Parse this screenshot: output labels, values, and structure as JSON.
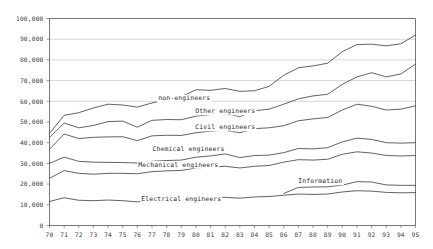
{
  "chart_data": {
    "type": "line",
    "title": "",
    "subtitle": "",
    "xlabel": "",
    "ylabel": "",
    "xlim": [
      70,
      95
    ],
    "ylim": [
      0,
      100000
    ],
    "grid": "horizontal-major-upper",
    "legend_position": "inline-labels",
    "y_ticks": [
      0,
      10000,
      20000,
      30000,
      40000,
      50000,
      60000,
      70000,
      80000,
      90000,
      100000
    ],
    "y_tick_labels": [
      "0",
      "10,000",
      "20,000",
      "30,000",
      "40,000",
      "50,000",
      "60,000",
      "70,000",
      "80,000",
      "90,000",
      "100,000"
    ],
    "x": [
      70,
      71,
      72,
      73,
      74,
      75,
      76,
      77,
      78,
      79,
      80,
      81,
      82,
      83,
      84,
      85,
      86,
      87,
      88,
      89,
      90,
      91,
      92,
      93,
      94,
      95
    ],
    "x_tick_labels": [
      "70",
      "71",
      "72",
      "73",
      "74",
      "75",
      "76",
      "77",
      "78",
      "79",
      "80",
      "81",
      "82",
      "83",
      "84",
      "85",
      "86",
      "87",
      "88",
      "89",
      "90",
      "91",
      "92",
      "93",
      "94",
      "95"
    ],
    "series": [
      {
        "name": "non-engineers",
        "label": "non-engineers",
        "label_x": 79.2,
        "label_y": 60500,
        "values": [
          44500,
          53200,
          54500,
          56800,
          58600,
          58200,
          57200,
          59200,
          60800,
          62200,
          65600,
          65300,
          66200,
          64800,
          65100,
          67200,
          72600,
          76200,
          77100,
          78400,
          84000,
          87400,
          87600,
          86800,
          87800,
          92000
        ]
      },
      {
        "name": "other-engineers",
        "label": "Other engineers",
        "label_x": 82.0,
        "label_y": 54200,
        "values": [
          42500,
          49500,
          47200,
          48300,
          50200,
          50400,
          47500,
          50800,
          51200,
          51100,
          52800,
          53600,
          54200,
          52600,
          55400,
          56200,
          58600,
          61200,
          62600,
          63400,
          68200,
          71800,
          73800,
          71800,
          73200,
          78000
        ]
      },
      {
        "name": "civil-engineers",
        "label": "Civil engineers",
        "label_x": 82.0,
        "label_y": 46500,
        "values": [
          36800,
          44200,
          42000,
          42600,
          42800,
          42900,
          41000,
          43300,
          43600,
          43500,
          44800,
          45600,
          46000,
          44800,
          46800,
          47200,
          48200,
          50600,
          51500,
          52200,
          55800,
          58600,
          57600,
          55800,
          56200,
          57800
        ]
      },
      {
        "name": "chemical-engineers",
        "label": "Chemical engineers",
        "label_x": 79.5,
        "label_y": 36200,
        "values": [
          30000,
          33000,
          31000,
          30600,
          30500,
          30400,
          30200,
          31000,
          31400,
          31600,
          33000,
          33600,
          34600,
          32800,
          33800,
          34000,
          35200,
          37200,
          37000,
          37600,
          40400,
          42200,
          41600,
          40000,
          39800,
          40000
        ]
      },
      {
        "name": "mechanical-engineers",
        "label": "Mechanical engineers",
        "label_x": 78.8,
        "label_y": 28500,
        "values": [
          22800,
          26500,
          25200,
          24800,
          25200,
          25200,
          25000,
          26000,
          26400,
          26600,
          27800,
          28200,
          28600,
          27800,
          28600,
          29000,
          30600,
          31800,
          31600,
          32000,
          34400,
          35600,
          35000,
          33800,
          33600,
          33800
        ]
      },
      {
        "name": "information",
        "label": "Information",
        "label_x": 88.5,
        "label_y": 20400,
        "start_index": 16,
        "values": [
          null,
          null,
          null,
          null,
          null,
          null,
          null,
          null,
          null,
          null,
          null,
          null,
          null,
          null,
          null,
          null,
          15500,
          18400,
          18600,
          18700,
          19500,
          21200,
          21000,
          19600,
          19400,
          19400
        ]
      },
      {
        "name": "electrical-engineers",
        "label": "Electrical engineers",
        "label_x": 79.0,
        "label_y": 12000,
        "values": [
          11600,
          13400,
          12200,
          12000,
          12300,
          12000,
          11400,
          12200,
          12400,
          12400,
          13200,
          13400,
          13600,
          13200,
          13800,
          14000,
          14600,
          15200,
          15000,
          15200,
          16200,
          16800,
          16600,
          16000,
          15800,
          15900
        ]
      }
    ]
  },
  "colors": {
    "line": "#3a3a3a",
    "grid": "#b9b9b9",
    "axis": "#555555",
    "tick_text": "#3b3b3b",
    "label_text": "#2a2a2a",
    "background": "#ffffff"
  }
}
